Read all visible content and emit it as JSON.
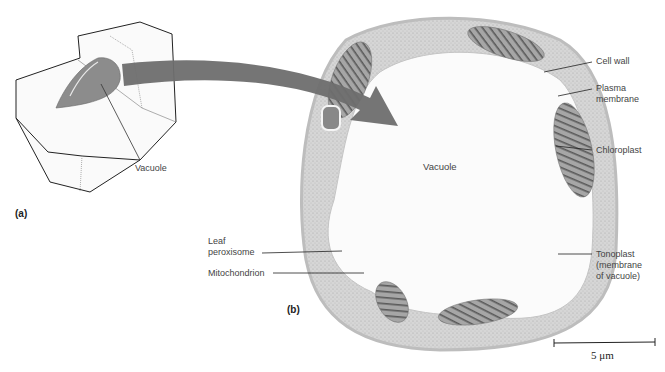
{
  "figure": {
    "panel_a": {
      "label": "(a)",
      "callouts": [
        {
          "id": "vacuole",
          "text": "Vacuole"
        }
      ]
    },
    "panel_b": {
      "label": "(b)",
      "center_label": "Vacuole",
      "callouts": [
        {
          "id": "cell-wall",
          "text": "Cell wall"
        },
        {
          "id": "plasma-membrane",
          "text": "Plasma\nmembrane"
        },
        {
          "id": "chloroplast",
          "text": "Chloroplast"
        },
        {
          "id": "tonoplast",
          "text": "Tonoplast\n(membrane\nof vacuole)"
        },
        {
          "id": "leaf-peroxisome",
          "text": "Leaf\nperoxisome"
        },
        {
          "id": "mitochondrion",
          "text": "Mitochondrion"
        }
      ]
    },
    "scale_bar": {
      "text": "5 μm"
    },
    "colors": {
      "arrow": "#6e6e6e",
      "vacuole_3d": "#8c8c8c",
      "cell_cytoplasm": "#cfcfcf",
      "chloroplast": "#8a8a8a",
      "outline": "#222222"
    }
  }
}
